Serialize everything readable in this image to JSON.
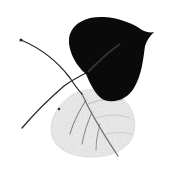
{
  "image": {
    "description": "Illustration of two overlapping leaves: a dark black heart-shaped leaf with pointed tip and a pale, faint veined leaf beneath it, with crossing stems",
    "colors": {
      "background": "#ffffff",
      "dark_leaf": "#0a0a0a",
      "pale_leaf": "#ececec",
      "veins": "#3a3a3a",
      "stem": "#2a2a2a"
    }
  }
}
